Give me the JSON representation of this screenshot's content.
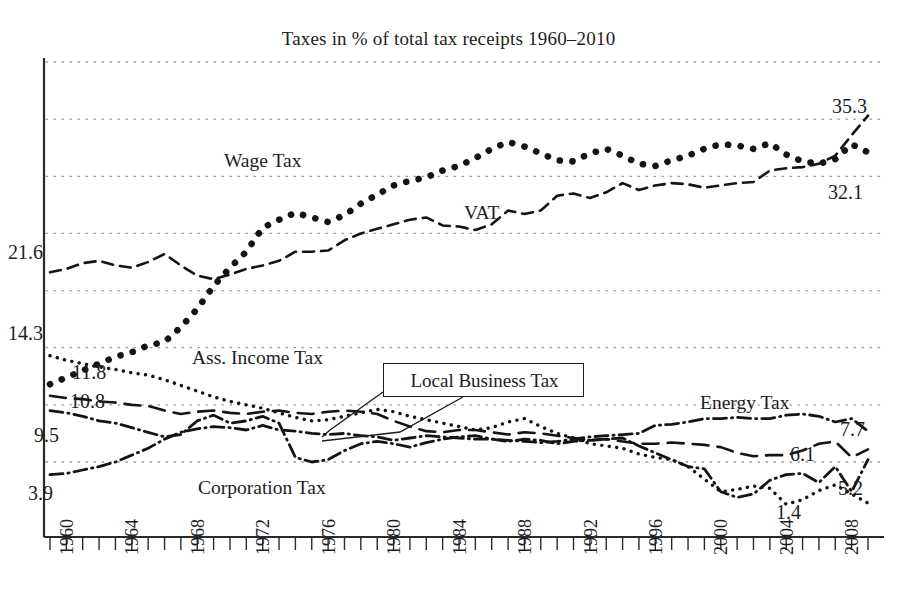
{
  "chart_data": {
    "type": "line",
    "title": "Taxes in % of total tax receipts 1960–2010",
    "xlabel": "",
    "ylabel": "",
    "grid": true,
    "legend_position": "inline-annotations",
    "ylim": [
      0,
      40
    ],
    "xlim": [
      1960,
      2010
    ],
    "x": [
      1960,
      1961,
      1962,
      1963,
      1964,
      1965,
      1966,
      1967,
      1968,
      1969,
      1970,
      1971,
      1972,
      1973,
      1974,
      1975,
      1976,
      1977,
      1978,
      1979,
      1980,
      1981,
      1982,
      1983,
      1984,
      1985,
      1986,
      1987,
      1988,
      1989,
      1990,
      1991,
      1992,
      1993,
      1994,
      1995,
      1996,
      1997,
      1998,
      1999,
      2000,
      2001,
      2002,
      2003,
      2004,
      2005,
      2006,
      2007,
      2008,
      2009,
      2010
    ],
    "xtick_labels": [
      "1960",
      "1964",
      "1968",
      "1972",
      "1976",
      "1980",
      "1984",
      "1988",
      "1992",
      "1996",
      "2000",
      "2004",
      "2008"
    ],
    "xtick_values": [
      1960,
      1964,
      1968,
      1972,
      1976,
      1980,
      1984,
      1988,
      1992,
      1996,
      2000,
      2004,
      2008
    ],
    "gridline_values": [
      40.0,
      35.0,
      30.0,
      25.0,
      20.0,
      15.0,
      10.0,
      5.0
    ],
    "series": [
      {
        "name": "Wage Tax",
        "style": "dotted-thick",
        "label_x": 1966.6,
        "label_y": 27.3,
        "start_value": "11.8",
        "end_value": "32.1",
        "values": [
          11.8,
          12.4,
          13.0,
          13.6,
          14.2,
          14.6,
          15.2,
          15.5,
          16.8,
          18.4,
          20.4,
          22.0,
          23.4,
          25.5,
          26.2,
          26.8,
          26.4,
          26.0,
          26.6,
          27.6,
          28.4,
          29.2,
          29.6,
          29.9,
          30.5,
          30.9,
          31.6,
          32.4,
          33.0,
          32.6,
          32.0,
          31.4,
          31.3,
          32.0,
          32.4,
          31.8,
          31.1,
          30.9,
          31.4,
          31.8,
          32.4,
          32.8,
          32.7,
          32.4,
          32.9,
          31.9,
          31.3,
          31.1,
          31.5,
          32.8,
          32.1
        ]
      },
      {
        "name": "VAT",
        "style": "dashed",
        "label_x": 1986.3,
        "label_y": 22.3,
        "start_value": "21.6",
        "end_value": "35.3",
        "values": [
          21.6,
          21.9,
          22.4,
          22.6,
          22.2,
          22.0,
          22.5,
          23.2,
          22.2,
          21.3,
          21.0,
          21.4,
          21.9,
          22.2,
          22.6,
          23.4,
          23.4,
          23.5,
          24.4,
          25.0,
          25.4,
          25.8,
          26.2,
          26.4,
          25.7,
          25.6,
          25.3,
          25.8,
          27.0,
          26.7,
          27.0,
          28.3,
          28.5,
          28.1,
          28.6,
          29.4,
          28.8,
          29.2,
          29.4,
          29.3,
          29.0,
          29.2,
          29.4,
          29.5,
          30.5,
          30.7,
          30.8,
          31.1,
          31.8,
          33.6,
          35.3
        ]
      },
      {
        "name": "Ass. Income Tax",
        "style": "dotted-fine",
        "label_x": 1964.6,
        "label_y": 14.7,
        "start_value": "14.3",
        "end_value": "1.4",
        "values": [
          14.3,
          13.9,
          13.6,
          13.3,
          13.1,
          12.8,
          12.6,
          12.2,
          11.7,
          11.2,
          10.7,
          10.3,
          10.0,
          9.7,
          9.3,
          8.9,
          8.6,
          8.7,
          9.0,
          9.3,
          9.6,
          9.4,
          9.0,
          8.7,
          8.4,
          8.1,
          7.8,
          8.0,
          8.5,
          8.8,
          8.1,
          7.5,
          7.1,
          6.6,
          6.4,
          6.2,
          5.7,
          5.4,
          5.2,
          4.6,
          3.5,
          2.4,
          2.6,
          2.9,
          2.7,
          1.3,
          1.7,
          2.5,
          3.0,
          2.2,
          1.4
        ]
      },
      {
        "name": "Local Business Tax",
        "style": "long-dashed",
        "callout": true,
        "start_value": "10.8",
        "end_value": "6.1",
        "values": [
          10.8,
          10.6,
          10.5,
          10.3,
          10.2,
          10.0,
          9.9,
          9.5,
          9.2,
          9.4,
          9.5,
          9.3,
          9.2,
          9.4,
          9.5,
          9.3,
          9.2,
          9.4,
          9.5,
          9.4,
          9.2,
          8.6,
          8.1,
          7.7,
          7.6,
          7.8,
          7.8,
          7.6,
          7.4,
          7.6,
          7.5,
          7.3,
          7.1,
          6.9,
          7.0,
          6.8,
          6.6,
          6.6,
          6.7,
          6.6,
          6.5,
          6.3,
          5.8,
          5.5,
          5.6,
          5.6,
          6.0,
          6.6,
          6.8,
          5.4,
          6.1
        ]
      },
      {
        "name": "Corporation Tax",
        "style": "dash-dot",
        "label_x": 1971.5,
        "label_y": 5.6,
        "start_value": "9.5",
        "end_value": "5.2",
        "values": [
          9.5,
          9.3,
          9.0,
          8.6,
          8.4,
          8.0,
          7.6,
          7.2,
          7.4,
          8.6,
          9.1,
          8.4,
          8.6,
          9.0,
          8.4,
          5.4,
          5.0,
          5.2,
          6.0,
          6.6,
          6.8,
          6.6,
          6.3,
          6.7,
          7.0,
          7.2,
          7.3,
          7.0,
          6.8,
          7.0,
          6.9,
          6.6,
          6.8,
          6.9,
          7.0,
          7.1,
          6.4,
          5.8,
          5.2,
          4.6,
          4.4,
          2.4,
          1.9,
          2.2,
          3.4,
          3.9,
          4.0,
          3.2,
          4.6,
          2.4,
          5.2
        ]
      },
      {
        "name": "Energy Tax",
        "style": "dash-dot",
        "label_x": 1998.8,
        "label_y": 11.0,
        "start_value": "3.9",
        "end_value": "7.7",
        "values": [
          3.9,
          4.0,
          4.3,
          4.6,
          5.0,
          5.6,
          6.2,
          7.0,
          7.6,
          7.9,
          8.1,
          8.0,
          7.8,
          8.2,
          7.8,
          7.7,
          7.5,
          7.4,
          7.5,
          7.3,
          7.2,
          6.9,
          7.1,
          7.3,
          7.2,
          7.1,
          7.0,
          7.0,
          6.9,
          6.8,
          6.7,
          6.8,
          7.0,
          7.2,
          7.3,
          7.4,
          7.5,
          8.2,
          8.3,
          8.5,
          8.8,
          8.8,
          8.9,
          8.8,
          8.8,
          9.1,
          9.2,
          9.0,
          8.5,
          8.8,
          7.7
        ]
      }
    ],
    "value_labels_left": [
      {
        "text": "21.6",
        "series": "VAT"
      },
      {
        "text": "14.3",
        "series": "Ass. Income Tax"
      },
      {
        "text": "11.8",
        "series": "Wage Tax"
      },
      {
        "text": "10.8",
        "series": "Local Business Tax"
      },
      {
        "text": "9.5",
        "series": "Corporation Tax"
      },
      {
        "text": "3.9",
        "series": "Energy Tax"
      }
    ],
    "value_labels_right": [
      {
        "text": "35.3",
        "series": "VAT"
      },
      {
        "text": "32.1",
        "series": "Wage Tax"
      },
      {
        "text": "7.7",
        "series": "Energy Tax"
      },
      {
        "text": "6.1",
        "series": "Local Business Tax"
      },
      {
        "text": "5.2",
        "series": "Corporation Tax"
      },
      {
        "text": "1.4",
        "series": "Ass. Income Tax"
      }
    ]
  },
  "labels": {
    "title": "Taxes in % of total tax receipts 1960–2010",
    "wage_tax": "Wage Tax",
    "vat": "VAT",
    "ass_income_tax": "Ass. Income Tax",
    "local_business_tax": "Local Business Tax",
    "corporation_tax": "Corporation Tax",
    "energy_tax": "Energy Tax"
  },
  "value_labels": {
    "l_216": "21.6",
    "l_143": "14.3",
    "l_118": "11.8",
    "l_108": "10.8",
    "l_95": "9.5",
    "l_39": "3.9",
    "r_353": "35.3",
    "r_321": "32.1",
    "r_77": "7.7",
    "r_61": "6.1",
    "r_52": "5.2",
    "r_14": "1.4"
  },
  "xaxis": {
    "t1960": "1960",
    "t1964": "1964",
    "t1968": "1968",
    "t1972": "1972",
    "t1976": "1976",
    "t1980": "1980",
    "t1984": "1984",
    "t1988": "1988",
    "t1992": "1992",
    "t1996": "1996",
    "t2000": "2000",
    "t2004": "2004",
    "t2008": "2008"
  }
}
